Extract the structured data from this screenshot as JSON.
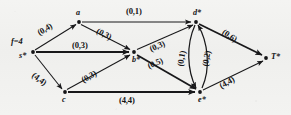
{
  "figure": {
    "type": "network-flow-diagram",
    "flow_value_label": "f=4"
  },
  "nodes": [
    {
      "id": "s",
      "label": "s*",
      "x": 33,
      "y": 52,
      "role": "source"
    },
    {
      "id": "a",
      "label": "a",
      "x": 79,
      "y": 22,
      "role": "intermediate"
    },
    {
      "id": "b",
      "label": "b*",
      "x": 134,
      "y": 52,
      "role": "intermediate"
    },
    {
      "id": "c",
      "label": "c",
      "x": 65,
      "y": 92,
      "role": "intermediate"
    },
    {
      "id": "d",
      "label": "d*",
      "x": 196,
      "y": 22,
      "role": "intermediate"
    },
    {
      "id": "e",
      "label": "e*",
      "x": 200,
      "y": 92,
      "role": "intermediate"
    },
    {
      "id": "t",
      "label": "T*",
      "x": 266,
      "y": 58,
      "role": "sink"
    }
  ],
  "edges": [
    {
      "id": "s-a",
      "from": "s",
      "to": "a",
      "label": "(0,4)",
      "flow": 0,
      "capacity": 4,
      "saturated": false,
      "style": "straight"
    },
    {
      "id": "s-b",
      "from": "s",
      "to": "b",
      "label": "(0,3)",
      "flow": 0,
      "capacity": 3,
      "saturated": false,
      "style": "thick"
    },
    {
      "id": "s-c",
      "from": "s",
      "to": "c",
      "label": "(4,4)",
      "flow": 4,
      "capacity": 4,
      "saturated": true,
      "style": "straight"
    },
    {
      "id": "a-d",
      "from": "a",
      "to": "d",
      "label": "(0,1)",
      "flow": 0,
      "capacity": 1,
      "saturated": false,
      "style": "straight"
    },
    {
      "id": "a-b",
      "from": "a",
      "to": "b",
      "label": "(0,3)",
      "flow": 0,
      "capacity": 3,
      "saturated": false,
      "style": "straight"
    },
    {
      "id": "c-b",
      "from": "c",
      "to": "b",
      "label": "(0,3)",
      "flow": 0,
      "capacity": 3,
      "saturated": false,
      "style": "straight"
    },
    {
      "id": "c-e",
      "from": "c",
      "to": "e",
      "label": "(4,4)",
      "flow": 4,
      "capacity": 4,
      "saturated": true,
      "style": "thick"
    },
    {
      "id": "b-d",
      "from": "b",
      "to": "d",
      "label": "(0,3)",
      "flow": 0,
      "capacity": 3,
      "saturated": false,
      "style": "straight"
    },
    {
      "id": "b-e",
      "from": "b",
      "to": "e",
      "label": "(0,5)",
      "flow": 0,
      "capacity": 5,
      "saturated": false,
      "style": "thick"
    },
    {
      "id": "d-e",
      "from": "d",
      "to": "e",
      "label": "(0,1)",
      "flow": 0,
      "capacity": 1,
      "saturated": false,
      "style": "curve-left"
    },
    {
      "id": "e-d",
      "from": "e",
      "to": "d",
      "label": "(0,2)",
      "flow": 0,
      "capacity": 2,
      "saturated": false,
      "style": "curve-right"
    },
    {
      "id": "d-t",
      "from": "d",
      "to": "t",
      "label": "(0,6)",
      "flow": 0,
      "capacity": 6,
      "saturated": false,
      "style": "thick"
    },
    {
      "id": "e-t",
      "from": "e",
      "to": "t",
      "label": "(4,4)",
      "flow": 4,
      "capacity": 4,
      "saturated": true,
      "style": "straight"
    }
  ],
  "labels": {
    "flow_value": "f=4",
    "node_s": "s*",
    "node_a": "a",
    "node_b": "b*",
    "node_c": "c",
    "node_d": "d*",
    "node_e": "e*",
    "node_t": "T*",
    "edge_s_a": "(0,4)",
    "edge_s_b": "(0,3)",
    "edge_s_c": "(4,4)",
    "edge_a_d": "(0,1)",
    "edge_a_b": "(0,3)",
    "edge_c_b": "(0,3)",
    "edge_c_e": "(4,4)",
    "edge_b_d": "(0,3)",
    "edge_b_e": "(0,5)",
    "edge_d_e": "(0,1)",
    "edge_e_d": "(0,2)",
    "edge_d_t": "(0,6)",
    "edge_e_t": "(4,4)"
  },
  "colors": {
    "ink": "#18181a",
    "paper": "#f2f2f0"
  }
}
